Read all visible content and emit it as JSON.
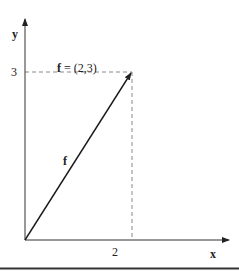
{
  "diagram": {
    "axis_x_label": "x",
    "axis_y_label": "y",
    "vector_equation_bold": "f",
    "vector_equation_rest": " = (2,3)",
    "vector_label": "f",
    "tick_x": "2",
    "tick_y": "3",
    "vector": {
      "x": 2,
      "y": 3
    },
    "colors": {
      "axis": "#333333",
      "vector": "#1a1a1a",
      "dashed": "#888888",
      "bottom_rule": "#333333"
    }
  }
}
